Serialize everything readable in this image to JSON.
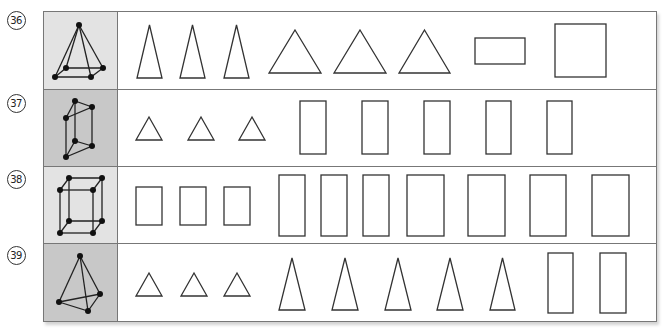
{
  "colors": {
    "cell_light": "#e3e3e3",
    "cell_dark": "#c8c8c8",
    "border": "#777777",
    "stroke": "#333333"
  },
  "rows": [
    {
      "number": "36",
      "solid": "square-pyramid",
      "cell_shade": "light",
      "shapes": [
        {
          "type": "tall-triangle",
          "x": 137,
          "y": 25,
          "w": 25,
          "h": 53
        },
        {
          "type": "tall-triangle",
          "x": 180,
          "y": 25,
          "w": 25,
          "h": 53
        },
        {
          "type": "tall-triangle",
          "x": 224,
          "y": 25,
          "w": 25,
          "h": 53
        },
        {
          "type": "wide-triangle",
          "x": 269,
          "y": 30,
          "w": 52,
          "h": 43
        },
        {
          "type": "wide-triangle",
          "x": 334,
          "y": 30,
          "w": 52,
          "h": 43
        },
        {
          "type": "wide-triangle",
          "x": 399,
          "y": 30,
          "w": 51,
          "h": 43
        },
        {
          "type": "rectangle",
          "x": 475,
          "y": 38,
          "w": 50,
          "h": 26
        },
        {
          "type": "rectangle",
          "x": 555,
          "y": 24,
          "w": 51,
          "h": 53
        }
      ]
    },
    {
      "number": "37",
      "solid": "triangular-prism",
      "cell_shade": "dark",
      "shapes": [
        {
          "type": "small-triangle",
          "x": 136,
          "y": 117,
          "w": 26,
          "h": 23
        },
        {
          "type": "small-triangle",
          "x": 188,
          "y": 117,
          "w": 26,
          "h": 23
        },
        {
          "type": "small-triangle",
          "x": 239,
          "y": 117,
          "w": 26,
          "h": 23
        },
        {
          "type": "rectangle",
          "x": 300,
          "y": 101,
          "w": 26,
          "h": 53
        },
        {
          "type": "rectangle",
          "x": 362,
          "y": 101,
          "w": 26,
          "h": 53
        },
        {
          "type": "rectangle",
          "x": 424,
          "y": 101,
          "w": 26,
          "h": 53
        },
        {
          "type": "rectangle",
          "x": 486,
          "y": 101,
          "w": 25,
          "h": 53
        },
        {
          "type": "rectangle",
          "x": 547,
          "y": 101,
          "w": 25,
          "h": 53
        }
      ]
    },
    {
      "number": "38",
      "solid": "rectangular-prism",
      "cell_shade": "light",
      "shapes": [
        {
          "type": "rectangle",
          "x": 136,
          "y": 187,
          "w": 26,
          "h": 38
        },
        {
          "type": "rectangle",
          "x": 180,
          "y": 187,
          "w": 26,
          "h": 38
        },
        {
          "type": "rectangle",
          "x": 224,
          "y": 187,
          "w": 26,
          "h": 38
        },
        {
          "type": "rectangle",
          "x": 279,
          "y": 175,
          "w": 26,
          "h": 61
        },
        {
          "type": "rectangle",
          "x": 321,
          "y": 175,
          "w": 26,
          "h": 61
        },
        {
          "type": "rectangle",
          "x": 363,
          "y": 175,
          "w": 26,
          "h": 61
        },
        {
          "type": "rectangle",
          "x": 407,
          "y": 175,
          "w": 37,
          "h": 61
        },
        {
          "type": "rectangle",
          "x": 468,
          "y": 175,
          "w": 37,
          "h": 61
        },
        {
          "type": "rectangle",
          "x": 530,
          "y": 175,
          "w": 36,
          "h": 61
        },
        {
          "type": "rectangle",
          "x": 592,
          "y": 175,
          "w": 37,
          "h": 61
        }
      ]
    },
    {
      "number": "39",
      "solid": "triangular-pyramid",
      "cell_shade": "dark",
      "shapes": [
        {
          "type": "small-triangle",
          "x": 136,
          "y": 273,
          "w": 26,
          "h": 23
        },
        {
          "type": "small-triangle",
          "x": 181,
          "y": 273,
          "w": 26,
          "h": 23
        },
        {
          "type": "small-triangle",
          "x": 224,
          "y": 273,
          "w": 26,
          "h": 23
        },
        {
          "type": "tall-triangle",
          "x": 279,
          "y": 258,
          "w": 26,
          "h": 52
        },
        {
          "type": "tall-triangle",
          "x": 332,
          "y": 258,
          "w": 26,
          "h": 52
        },
        {
          "type": "tall-triangle",
          "x": 385,
          "y": 258,
          "w": 26,
          "h": 52
        },
        {
          "type": "tall-triangle",
          "x": 437,
          "y": 258,
          "w": 26,
          "h": 52
        },
        {
          "type": "tall-triangle",
          "x": 490,
          "y": 258,
          "w": 25,
          "h": 52
        },
        {
          "type": "rectangle",
          "x": 548,
          "y": 253,
          "w": 25,
          "h": 60
        },
        {
          "type": "rectangle",
          "x": 600,
          "y": 253,
          "w": 26,
          "h": 60
        }
      ]
    }
  ]
}
